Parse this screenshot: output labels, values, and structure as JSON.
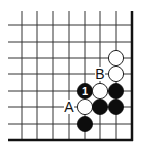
{
  "diagram": {
    "type": "go-board-fragment",
    "corner": "bottom-right",
    "colors": {
      "background": "#ffffff",
      "line": "#333333",
      "edge": "#111111",
      "black_stone": "#0d0d0d",
      "white_stone": "#ffffff"
    },
    "grid": {
      "x_lines": [
        22,
        37,
        53,
        69,
        85,
        100,
        116
      ],
      "edge_x": 132,
      "y_lines": [
        25,
        42,
        58,
        74,
        91,
        107,
        124
      ],
      "edge_y": 140,
      "top_start": 11,
      "left_start": 8
    },
    "stones": [
      {
        "color": "white",
        "x": 116,
        "y": 58
      },
      {
        "color": "white",
        "x": 116,
        "y": 74
      },
      {
        "color": "black",
        "x": 85,
        "y": 91,
        "number": "1"
      },
      {
        "color": "white",
        "x": 100,
        "y": 91
      },
      {
        "color": "black",
        "x": 116,
        "y": 91
      },
      {
        "color": "white",
        "x": 85,
        "y": 107
      },
      {
        "color": "black",
        "x": 100,
        "y": 107
      },
      {
        "color": "black",
        "x": 116,
        "y": 107
      },
      {
        "color": "black",
        "x": 85,
        "y": 124
      }
    ],
    "labels": [
      {
        "text": "B",
        "x": 100,
        "y": 74
      },
      {
        "text": "A",
        "x": 69,
        "y": 107
      }
    ]
  }
}
